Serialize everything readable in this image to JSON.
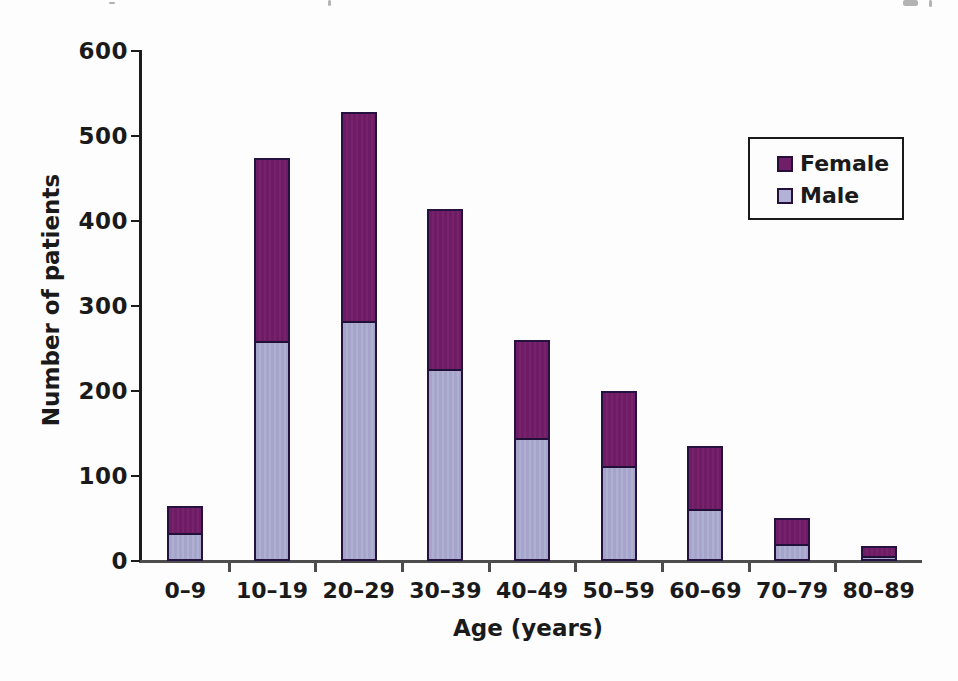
{
  "chart_data": {
    "type": "bar",
    "stacked": true,
    "title": "",
    "xlabel": "Age (years)",
    "ylabel": "Number of patients",
    "categories": [
      "0–9",
      "10–19",
      "20–29",
      "30–39",
      "40–49",
      "50–59",
      "60–69",
      "70–79",
      "80–89"
    ],
    "series": [
      {
        "name": "Male",
        "color": "#a6a7cb",
        "values": [
          33,
          259,
          282,
          226,
          145,
          112,
          61,
          20,
          6
        ]
      },
      {
        "name": "Female",
        "color": "#701e67",
        "values": [
          32,
          215,
          246,
          188,
          115,
          88,
          74,
          30,
          12
        ]
      }
    ],
    "stack_totals": [
      65,
      474,
      528,
      414,
      260,
      200,
      135,
      50,
      18
    ],
    "ylim": [
      0,
      600
    ],
    "yticks": [
      0,
      100,
      200,
      300,
      400,
      500,
      600
    ],
    "grid": false,
    "legend_position": "upper right"
  },
  "legend": {
    "entries": [
      {
        "label": "Female",
        "color": "#701e67"
      },
      {
        "label": "Male",
        "color": "#b2b2d8"
      }
    ]
  },
  "colors": {
    "female_fill": "#701e67",
    "male_fill": "#a6a7cb",
    "bar_border": "#261240",
    "y_axis": "#1c1c1c",
    "x_axis": "#4d4d4d",
    "text": "#1a1a1a"
  },
  "artifacts": [
    {
      "x": 109,
      "y": 2,
      "w": 6,
      "h": 2
    },
    {
      "x": 328,
      "y": 0,
      "w": 3,
      "h": 6
    },
    {
      "x": 903,
      "y": 0,
      "w": 15,
      "h": 6
    },
    {
      "x": 929,
      "y": 0,
      "w": 3,
      "h": 7
    }
  ]
}
